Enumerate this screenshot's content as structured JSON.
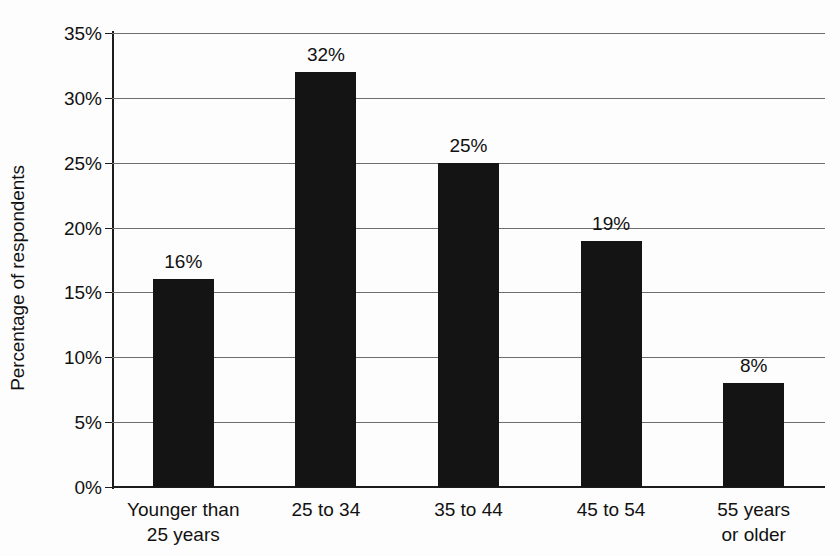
{
  "chart_data": {
    "type": "bar",
    "title": "",
    "subtitle": "",
    "xlabel": "",
    "ylabel": "Percentage of respondents",
    "categories": [
      "Younger than 25 years",
      "25 to 34",
      "35 to 44",
      "45 to 54",
      "55 years or older"
    ],
    "category_lines": [
      [
        "Younger than",
        "25 years"
      ],
      [
        "25 to 34"
      ],
      [
        "35 to 44"
      ],
      [
        "45 to 54"
      ],
      [
        "55 years",
        "or older"
      ]
    ],
    "values": [
      16,
      32,
      25,
      19,
      8
    ],
    "value_labels": [
      "16%",
      "32%",
      "25%",
      "19%",
      "8%"
    ],
    "ylim": [
      0,
      35
    ],
    "ytick_values": [
      0,
      5,
      10,
      15,
      20,
      25,
      30,
      35
    ],
    "ytick_labels": [
      "0%",
      "5%",
      "10%",
      "15%",
      "20%",
      "25%",
      "30%",
      "35%"
    ],
    "grid": true,
    "legend": null,
    "legend_position": "none",
    "bar_color": "#141414",
    "gridline_color": "#6e6e6e",
    "axis_color": "#1c1c1c",
    "background_color": "#fdfdfd"
  }
}
